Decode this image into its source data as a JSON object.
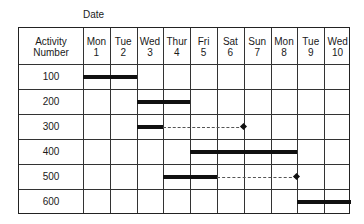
{
  "title": "Date",
  "table": {
    "row_header": [
      "Activity",
      "Number"
    ],
    "days": [
      {
        "day": "Mon",
        "date": "1"
      },
      {
        "day": "Tue",
        "date": "2"
      },
      {
        "day": "Wed",
        "date": "3"
      },
      {
        "day": "Thur",
        "date": "4"
      },
      {
        "day": "Fri",
        "date": "5"
      },
      {
        "day": "Sat",
        "date": "6"
      },
      {
        "day": "Sun",
        "date": "7"
      },
      {
        "day": "Mon",
        "date": "8"
      },
      {
        "day": "Tue",
        "date": "9"
      },
      {
        "day": "Wed",
        "date": "10"
      }
    ],
    "activities": [
      "100",
      "200",
      "300",
      "400",
      "500",
      "600"
    ]
  },
  "chart_data": {
    "type": "gantt",
    "title": "Date",
    "xlabel": "Date",
    "ylabel": "Activity Number",
    "categories": [
      "Mon 1",
      "Tue 2",
      "Wed 3",
      "Thur 4",
      "Fri 5",
      "Sat 6",
      "Sun 7",
      "Mon 8",
      "Tue 9",
      "Wed 10"
    ],
    "tasks": [
      {
        "activity": "100",
        "start": "Mon 1",
        "end": "Tue 2",
        "start_index": 0,
        "end_index": 1,
        "slack_to": null
      },
      {
        "activity": "200",
        "start": "Wed 3",
        "end": "Thur 4",
        "start_index": 2,
        "end_index": 3,
        "slack_to": null
      },
      {
        "activity": "300",
        "start": "Wed 3",
        "end": "Wed 3",
        "start_index": 2,
        "end_index": 2,
        "slack_to": "Sat 6",
        "slack_to_index": 5
      },
      {
        "activity": "400",
        "start": "Fri 5",
        "end": "Mon 8",
        "start_index": 4,
        "end_index": 7,
        "slack_to": null
      },
      {
        "activity": "500",
        "start": "Thur 4",
        "end": "Fri 5",
        "start_index": 3,
        "end_index": 4,
        "slack_to": "Mon 8",
        "slack_to_index": 7
      },
      {
        "activity": "600",
        "start": "Tue 9",
        "end": "Wed 10",
        "start_index": 8,
        "end_index": 9,
        "slack_to": null
      }
    ],
    "legend": {
      "solid_bar": "scheduled activity",
      "dashed_line_with_diamond": "slack"
    },
    "grid": true
  }
}
